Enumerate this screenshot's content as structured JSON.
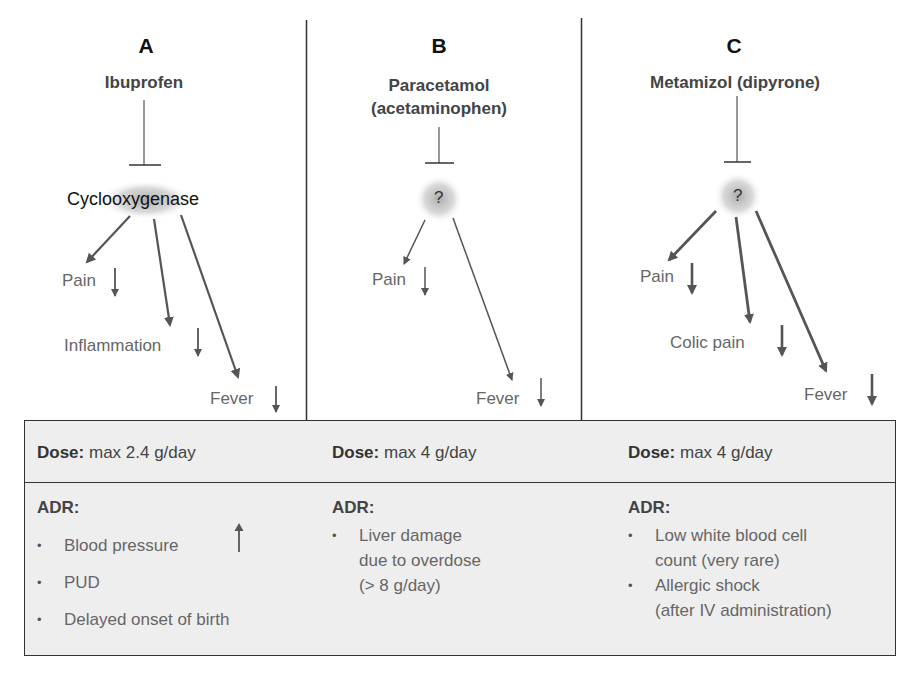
{
  "panels": [
    {
      "letter": "A",
      "drug": "Ibuprofen",
      "drug_line2": "",
      "target": "Cyclooxygenase",
      "effects": [
        {
          "label": "Pain",
          "direction": "down"
        },
        {
          "label": "Inflammation",
          "direction": "down"
        },
        {
          "label": "Fever",
          "direction": "down"
        }
      ],
      "dose_label": "Dose:",
      "dose_value": "max 2.4 g/day",
      "adr_label": "ADR:",
      "adr_items": [
        {
          "text": "Blood pressure",
          "indicator": "up"
        },
        {
          "text": "PUD",
          "indicator": ""
        },
        {
          "text": "Delayed onset of birth",
          "indicator": ""
        }
      ]
    },
    {
      "letter": "B",
      "drug": "Paracetamol",
      "drug_line2": "(acetaminophen)",
      "target": "?",
      "effects": [
        {
          "label": "Pain",
          "direction": "down"
        },
        {
          "label": "Fever",
          "direction": "down"
        }
      ],
      "dose_label": "Dose:",
      "dose_value": "max 4 g/day",
      "adr_label": "ADR:",
      "adr_items": [
        {
          "text": "Liver damage due to overdose (> 8 g/day)",
          "lines": [
            "Liver damage",
            "due to overdose",
            "(> 8 g/day)"
          ]
        }
      ]
    },
    {
      "letter": "C",
      "drug": "Metamizol (dipyrone)",
      "drug_line2": "",
      "target": "?",
      "effects": [
        {
          "label": "Pain",
          "direction": "down"
        },
        {
          "label": "Colic pain",
          "direction": "down"
        },
        {
          "label": "Fever",
          "direction": "down"
        }
      ],
      "dose_label": "Dose:",
      "dose_value": "max 4 g/day",
      "adr_label": "ADR:",
      "adr_items": [
        {
          "text": "Low white blood cell count (very rare)",
          "lines": [
            "Low white blood cell",
            "count (very rare)"
          ]
        },
        {
          "text": "Allergic shock (after IV administration)",
          "lines": [
            "Allergic shock",
            "(after IV administration)"
          ]
        }
      ]
    }
  ],
  "colors": {
    "line": "#333333",
    "arrow": "#555555",
    "table_bg": "#eeeeee",
    "heading": "#111111",
    "label": "#666666"
  }
}
